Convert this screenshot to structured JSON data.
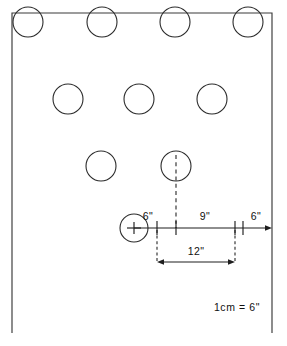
{
  "drawing": {
    "title": "Hole spacing layout",
    "scale_note": "1cm = 6\"",
    "panel": {
      "left": 12,
      "top": 13,
      "right": 272,
      "bottom": 333,
      "stroke": "#3a3a3a"
    },
    "hole_rows": [
      {
        "row_label": "top-row",
        "cy": 22,
        "r": 15,
        "centers_x": [
          28,
          102,
          175,
          248
        ]
      },
      {
        "row_label": "middle-row",
        "cy": 99,
        "r": 15,
        "centers_x": [
          68,
          139,
          212
        ]
      },
      {
        "row_label": "lower-row",
        "cy": 166,
        "r": 15,
        "centers_x": [
          101,
          176
        ]
      },
      {
        "row_label": "datum-row",
        "cy": 228,
        "r": 14,
        "centers_x": [
          134
        ]
      }
    ],
    "dimension_line": {
      "y": 228,
      "start_x": 134,
      "end_x": 272,
      "stations_x": [
        134,
        157,
        176,
        235,
        272
      ]
    },
    "dimensions": [
      {
        "id": "dim-6-left",
        "label": "6\"",
        "value": 6,
        "unit": "in",
        "x": 166,
        "y": 220
      },
      {
        "id": "dim-9-mid",
        "label": "9\"",
        "value": 9,
        "unit": "in",
        "x": 205,
        "y": 220
      },
      {
        "id": "dim-6-right",
        "label": "6\"",
        "value": 6,
        "unit": "in",
        "x": 254,
        "y": 220
      },
      {
        "id": "dim-12-span",
        "label": "12\"",
        "value": 12,
        "unit": "in",
        "x": 196,
        "y": 252
      }
    ],
    "lower_dimension": {
      "y": 262,
      "start_x": 157,
      "end_x": 235
    },
    "centerline": {
      "x": 176,
      "top_y": 155,
      "bottom_y": 228
    },
    "extension_lines": [
      {
        "id": "ext-left",
        "x": 157,
        "top_y": 230,
        "bottom_y": 262
      },
      {
        "id": "ext-right",
        "x": 235,
        "top_y": 230,
        "bottom_y": 262
      }
    ],
    "scale": {
      "label": "1cm = 6\"",
      "x": 237,
      "y": 311
    }
  }
}
